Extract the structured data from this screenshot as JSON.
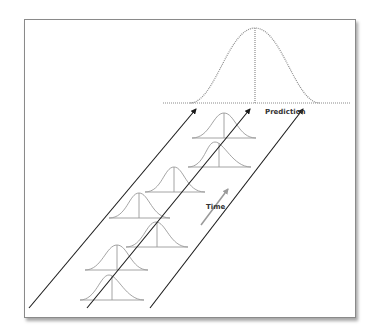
{
  "diagram": {
    "labels": {
      "prediction": "Prediction",
      "time": "Time"
    },
    "colors": {
      "frame_border": "#8a8a8a",
      "arrow_line": "#1a1a1a",
      "small_curve": "#9a9a9a",
      "prediction_curve": "#8c8c8c",
      "time_arrow": "#9a9a9a"
    },
    "components": [
      {
        "type": "prediction-distribution",
        "style": "dotted",
        "description": "Large normal distribution at top representing the prediction"
      },
      {
        "type": "time-lanes",
        "count": 3,
        "description": "Three parallel diagonal arrows pointing up-right"
      },
      {
        "type": "historical-distributions",
        "count": 7,
        "description": "Small normal distributions along the lanes, each with a vertical mean line"
      },
      {
        "type": "time-arrow",
        "description": "Gray arrow labeled Time pointing up-right"
      }
    ]
  }
}
